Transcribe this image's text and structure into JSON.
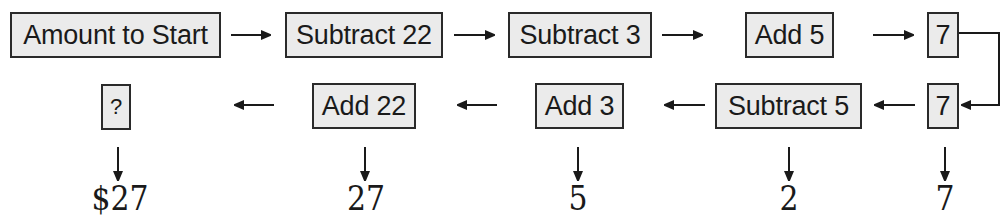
{
  "diagram": {
    "type": "flowchart-work-backwards",
    "forward_row": {
      "steps": [
        {
          "label": "Amount to Start"
        },
        {
          "label": "Subtract 22"
        },
        {
          "label": "Subtract 3"
        },
        {
          "label": "Add 5"
        },
        {
          "label": "7"
        }
      ]
    },
    "reverse_row": {
      "steps": [
        {
          "label": "7"
        },
        {
          "label": "Subtract 5"
        },
        {
          "label": "Add 3"
        },
        {
          "label": "Add 22"
        },
        {
          "label": "?"
        }
      ]
    },
    "results": [
      {
        "under": "?",
        "value": "$27"
      },
      {
        "under": "Add 22",
        "value": "27"
      },
      {
        "under": "Add 3",
        "value": "5"
      },
      {
        "under": "Subtract 5",
        "value": "2"
      },
      {
        "under": "7",
        "value": "7"
      }
    ],
    "colors": {
      "box_fill": "#ebebeb",
      "box_border": "#2a2a2a",
      "arrow": "#1a1a1a"
    }
  }
}
